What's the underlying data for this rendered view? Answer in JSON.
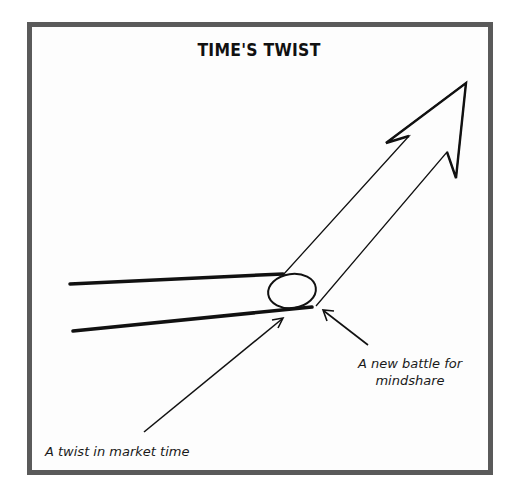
{
  "figure": {
    "title": "TIME'S TWIST",
    "annotations": {
      "battle": {
        "line1": "A new battle for",
        "line2": "mindshare"
      },
      "twist": "A twist in market time"
    },
    "colors": {
      "border": "#5a5a5a",
      "ink": "#111111",
      "background": "#ffffff"
    },
    "elements": [
      "two converging thick lines (past trajectory)",
      "ellipse twist joint",
      "large hollow arrow pointing up-right",
      "pointer arrow to twist",
      "pointer arrow to lower junction"
    ]
  }
}
